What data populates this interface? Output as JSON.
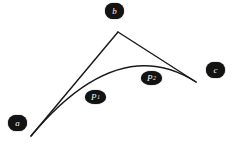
{
  "figure": {
    "type": "bezier-curve-diagram",
    "background_color": "#ffffff",
    "stroke_color": "#1a1a1a",
    "badge_color": "#131313",
    "badge_text_color": "#f2f2f2",
    "width": 233,
    "height": 144
  },
  "labels": {
    "a": "a",
    "b": "b",
    "c": "c",
    "p1_base": "P",
    "p1_sub": "1",
    "p2_base": "P",
    "p2_sub": "2"
  },
  "geometry": {
    "control_polygon": {
      "name": "control-polygon",
      "points": [
        {
          "label": "a",
          "x": 31,
          "y": 136
        },
        {
          "label": "b",
          "x": 118,
          "y": 32
        },
        {
          "label": "c",
          "x": 196,
          "y": 82
        }
      ]
    },
    "curve": {
      "name": "bezier-curve",
      "start": {
        "x": 31,
        "y": 136
      },
      "control": {
        "x": 118,
        "y": 32
      },
      "end": {
        "x": 196,
        "y": 82
      },
      "degree": 2
    },
    "annotated_points": [
      {
        "label": "P1",
        "x": 95,
        "y": 97
      },
      {
        "label": "P2",
        "x": 151,
        "y": 78
      }
    ]
  }
}
